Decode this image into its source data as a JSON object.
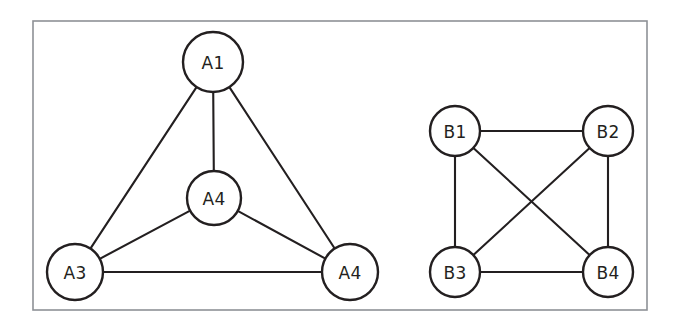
{
  "figure": {
    "background_color": "#ffffff",
    "frame": {
      "name": "outer border",
      "x": 33,
      "y": 21,
      "width": 614,
      "height": 289,
      "stroke_color": "#8e9196",
      "stroke_width": 1.6
    },
    "style": {
      "node_fill": "#ffffff",
      "node_stroke": "#231f20",
      "edge_stroke": "#231f20",
      "label_color": "#231f20"
    }
  },
  "graphs": [
    {
      "id": "graph-a",
      "name": "Graph A",
      "layout": "triangle-with-center",
      "nodes": [
        {
          "id": "a1",
          "label": "A1",
          "cx": 213,
          "cy": 62,
          "r": 30
        },
        {
          "id": "a2",
          "label": "A4",
          "cx": 214,
          "cy": 198,
          "r": 27
        },
        {
          "id": "a3",
          "label": "A3",
          "cx": 75,
          "cy": 272,
          "r": 28
        },
        {
          "id": "a4",
          "label": "A4",
          "cx": 350,
          "cy": 272,
          "r": 28
        }
      ],
      "edges": [
        {
          "id": "a1-a3",
          "from": "a1",
          "to": "a3"
        },
        {
          "id": "a1-a2",
          "from": "a1",
          "to": "a2"
        },
        {
          "id": "a1-a4",
          "from": "a1",
          "to": "a4"
        },
        {
          "id": "a2-a3",
          "from": "a2",
          "to": "a3"
        },
        {
          "id": "a2-a4",
          "from": "a2",
          "to": "a4"
        },
        {
          "id": "a3-a4",
          "from": "a3",
          "to": "a4"
        }
      ]
    },
    {
      "id": "graph-b",
      "name": "Graph B",
      "layout": "square-with-diagonals",
      "nodes": [
        {
          "id": "b1",
          "label": "B1",
          "cx": 455,
          "cy": 131,
          "r": 25
        },
        {
          "id": "b2",
          "label": "B2",
          "cx": 608,
          "cy": 131,
          "r": 25
        },
        {
          "id": "b3",
          "label": "B3",
          "cx": 455,
          "cy": 272,
          "r": 25
        },
        {
          "id": "b4",
          "label": "B4",
          "cx": 608,
          "cy": 272,
          "r": 25
        }
      ],
      "edges": [
        {
          "id": "b1-b2",
          "from": "b1",
          "to": "b2"
        },
        {
          "id": "b1-b3",
          "from": "b1",
          "to": "b3"
        },
        {
          "id": "b1-b4",
          "from": "b1",
          "to": "b4"
        },
        {
          "id": "b2-b3",
          "from": "b2",
          "to": "b3"
        },
        {
          "id": "b2-b4",
          "from": "b2",
          "to": "b4"
        },
        {
          "id": "b3-b4",
          "from": "b3",
          "to": "b4"
        }
      ]
    }
  ]
}
